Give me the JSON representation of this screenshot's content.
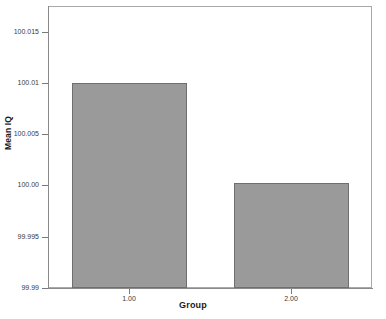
{
  "chart_data": {
    "type": "bar",
    "title": "",
    "xlabel": "Group",
    "ylabel": "Mean IQ",
    "categories": [
      "1.00",
      "2.00"
    ],
    "values": [
      100.01,
      100.0002
    ],
    "ylim": [
      99.99,
      100.0175
    ],
    "yticks": [
      99.99,
      99.995,
      100.0,
      100.005,
      100.01,
      100.015
    ],
    "ytick_labels": [
      "99.99",
      "99.995",
      "100.00",
      "100.005",
      "100.01",
      "100.015"
    ],
    "xtick_labels": [
      "1.00",
      "2.00"
    ],
    "grid": false,
    "legend": false,
    "bar_color": "#9a9a9a",
    "bar_edge_color": "#6f6f6f",
    "frame_color": "#a8a8a8",
    "background": "#ffffff"
  }
}
